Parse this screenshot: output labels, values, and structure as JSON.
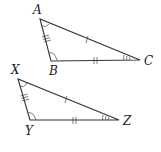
{
  "diagram": {
    "triangles": [
      {
        "name": "triangle-abc",
        "vertices": {
          "A": {
            "label": "A",
            "x": 40,
            "y": 19,
            "label_x": 33,
            "label_y": 14
          },
          "B": {
            "label": "B",
            "x": 51,
            "y": 61,
            "label_x": 49,
            "label_y": 75
          },
          "C": {
            "label": "C",
            "x": 140,
            "y": 60,
            "label_x": 144,
            "label_y": 65
          }
        },
        "side_marks": {
          "AB": 3,
          "BC": 2,
          "AC": 1
        },
        "angle_marks": {
          "A": 1,
          "B": 1,
          "C": 3
        }
      },
      {
        "name": "triangle-xyz",
        "vertices": {
          "X": {
            "label": "X",
            "x": 18,
            "y": 79,
            "label_x": 11,
            "label_y": 74
          },
          "Y": {
            "label": "Y",
            "x": 30,
            "y": 120,
            "label_x": 25,
            "label_y": 135
          },
          "Z": {
            "label": "Z",
            "x": 119,
            "y": 120,
            "label_x": 123,
            "label_y": 125
          }
        },
        "side_marks": {
          "XY": 3,
          "YZ": 2,
          "XZ": 1
        },
        "angle_marks": {
          "X": 1,
          "Y": 1,
          "Z": 3
        }
      }
    ]
  }
}
